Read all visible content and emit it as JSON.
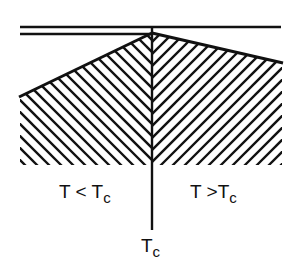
{
  "diagram": {
    "type": "phase-boundary-schematic",
    "colors": {
      "ink": "#111111",
      "background": "#ffffff"
    },
    "labels": {
      "left_region": {
        "main": "T < T",
        "sub": "c"
      },
      "right_region": {
        "main": "T >T",
        "sub": "c"
      },
      "axis": {
        "main": "T",
        "sub": "c"
      }
    }
  }
}
